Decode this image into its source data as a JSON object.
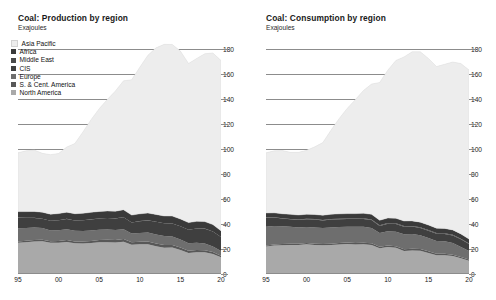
{
  "panels": [
    {
      "title": "Coal: Production by region",
      "subtitle": "Exajoules"
    },
    {
      "title": "Coal: Consumption by region",
      "subtitle": "Exajoules"
    }
  ],
  "legend": {
    "items": [
      {
        "label": "Asia Pacific",
        "color": "#ededed"
      },
      {
        "label": "Africa",
        "color": "#3a3a3a"
      },
      {
        "label": "Middle East",
        "color": "#4a4a4a"
      },
      {
        "label": "CIS",
        "color": "#3f3f3f"
      },
      {
        "label": "Europe",
        "color": "#6e6e6e"
      },
      {
        "label": "S. & Cent. America",
        "color": "#585858"
      },
      {
        "label": "North America",
        "color": "#a9a9a9"
      }
    ]
  },
  "axes": {
    "y_ticks": [
      0,
      20,
      40,
      60,
      80,
      100,
      120,
      140,
      160,
      180
    ],
    "y_min": 0,
    "y_max": 190,
    "x_ticks": [
      "95",
      "00",
      "05",
      "10",
      "15",
      "20"
    ],
    "x_tick_years": [
      1995,
      2000,
      2005,
      2010,
      2015,
      2020
    ],
    "x_min": 1995,
    "x_max": 2020,
    "ylabel": "Exajoules",
    "grid": true
  },
  "chart_data": {
    "type": "area",
    "stacked": true,
    "xlabel": "",
    "ylabel": "Exajoules",
    "ylim": [
      0,
      190
    ],
    "xlim": [
      1995,
      2020
    ],
    "legend_position": "top-left",
    "grid": true,
    "x": [
      1995,
      1996,
      1997,
      1998,
      1999,
      2000,
      2001,
      2002,
      2003,
      2004,
      2005,
      2006,
      2007,
      2008,
      2009,
      2010,
      2011,
      2012,
      2013,
      2014,
      2015,
      2016,
      2017,
      2018,
      2019,
      2020
    ],
    "charts": [
      {
        "name": "Coal: Production by region",
        "series": [
          {
            "name": "North America",
            "values": [
              25.0,
              25.4,
              26.0,
              26.2,
              24.9,
              25.0,
              25.6,
              24.5,
              24.3,
              24.7,
              25.4,
              25.4,
              25.1,
              25.8,
              23.4,
              23.7,
              23.8,
              22.1,
              21.0,
              21.1,
              19.1,
              16.7,
              17.3,
              17.3,
              15.9,
              13.3
            ]
          },
          {
            "name": "S. & Cent. America",
            "values": [
              1.0,
              1.1,
              1.2,
              1.2,
              1.3,
              1.4,
              1.5,
              1.5,
              1.6,
              1.7,
              1.8,
              1.9,
              2.0,
              2.1,
              2.0,
              2.1,
              2.2,
              2.2,
              2.2,
              2.1,
              2.0,
              1.9,
              1.8,
              1.7,
              1.6,
              1.2
            ]
          },
          {
            "name": "Europe",
            "values": [
              10.5,
              10.2,
              9.9,
              9.3,
              8.6,
              8.5,
              8.6,
              8.5,
              8.4,
              8.3,
              8.1,
              8.2,
              8.0,
              7.8,
              7.0,
              7.0,
              7.1,
              7.3,
              7.1,
              6.8,
              6.5,
              6.0,
              5.8,
              5.3,
              4.5,
              3.8
            ]
          },
          {
            "name": "CIS",
            "values": [
              8.5,
              8.2,
              7.7,
              7.4,
              7.7,
              8.0,
              8.3,
              8.2,
              8.6,
              8.9,
              9.0,
              9.2,
              9.3,
              9.6,
              8.7,
              9.4,
              9.7,
              10.1,
              10.2,
              10.3,
              10.5,
              10.7,
              11.4,
              11.9,
              11.9,
              11.2
            ]
          },
          {
            "name": "Middle East",
            "values": [
              0.03,
              0.03,
              0.03,
              0.03,
              0.03,
              0.03,
              0.03,
              0.03,
              0.03,
              0.03,
              0.03,
              0.03,
              0.03,
              0.03,
              0.03,
              0.03,
              0.03,
              0.03,
              0.03,
              0.03,
              0.03,
              0.03,
              0.03,
              0.03,
              0.03,
              0.03
            ]
          },
          {
            "name": "Africa",
            "values": [
              4.8,
              4.9,
              5.1,
              5.2,
              5.2,
              5.3,
              5.3,
              5.4,
              5.5,
              5.6,
              5.6,
              5.6,
              5.7,
              5.9,
              5.9,
              5.8,
              5.8,
              5.8,
              5.8,
              5.9,
              5.8,
              5.7,
              5.7,
              5.6,
              5.5,
              4.9
            ]
          },
          {
            "name": "Asia Pacific",
            "values": [
              47.0,
              48.5,
              49.0,
              47.0,
              47.5,
              48.0,
              52.0,
              56.0,
              65.0,
              74.0,
              82.0,
              89.0,
              96.0,
              103.0,
              108.0,
              117.0,
              126.0,
              133.0,
              137.0,
              137.0,
              134.0,
              127.0,
              130.0,
              134.0,
              137.0,
              136.0
            ]
          }
        ]
      },
      {
        "name": "Coal: Consumption by region",
        "series": [
          {
            "name": "North America",
            "values": [
              22.0,
              22.7,
              23.0,
              23.2,
              23.2,
              23.8,
              23.2,
              23.0,
              23.2,
              23.6,
              24.0,
              23.6,
              23.8,
              23.2,
              20.6,
              21.6,
              20.9,
              18.4,
              18.8,
              18.6,
              16.8,
              15.0,
              14.9,
              14.3,
              12.6,
              10.6
            ]
          },
          {
            "name": "S. & Cent. America",
            "values": [
              0.8,
              0.8,
              0.9,
              0.9,
              0.9,
              1.0,
              1.0,
              1.0,
              1.0,
              1.1,
              1.1,
              1.2,
              1.2,
              1.3,
              1.2,
              1.2,
              1.3,
              1.3,
              1.3,
              1.3,
              1.3,
              1.2,
              1.2,
              1.1,
              1.0,
              0.9
            ]
          },
          {
            "name": "Europe",
            "values": [
              15.0,
              14.8,
              14.3,
              13.7,
              13.0,
              12.8,
              13.0,
              12.7,
              13.0,
              12.9,
              12.7,
              12.9,
              12.8,
              12.3,
              11.0,
              11.3,
              11.6,
              12.0,
              11.8,
              11.0,
              10.7,
              10.2,
              10.0,
              9.3,
              8.0,
              6.8
            ]
          },
          {
            "name": "CIS",
            "values": [
              7.2,
              6.8,
              6.1,
              5.9,
              6.1,
              6.2,
              6.3,
              6.1,
              6.3,
              6.2,
              6.1,
              6.2,
              6.2,
              6.3,
              5.6,
              6.1,
              6.2,
              6.1,
              6.0,
              5.9,
              5.8,
              5.8,
              5.9,
              6.1,
              6.1,
              5.7
            ]
          },
          {
            "name": "Middle East",
            "values": [
              0.3,
              0.3,
              0.3,
              0.3,
              0.3,
              0.3,
              0.4,
              0.4,
              0.4,
              0.4,
              0.4,
              0.4,
              0.5,
              0.5,
              0.5,
              0.5,
              0.5,
              0.5,
              0.5,
              0.5,
              0.5,
              0.5,
              0.5,
              0.5,
              0.5,
              0.4
            ]
          },
          {
            "name": "Africa",
            "values": [
              3.4,
              3.4,
              3.5,
              3.6,
              3.6,
              3.6,
              3.6,
              3.7,
              3.8,
              3.8,
              3.9,
              3.9,
              4.0,
              4.0,
              4.0,
              4.0,
              4.0,
              4.0,
              4.0,
              4.1,
              4.0,
              3.9,
              3.9,
              3.9,
              3.8,
              3.5
            ]
          },
          {
            "name": "Asia Pacific",
            "values": [
              48.0,
              49.5,
              50.5,
              49.5,
              50.0,
              51.0,
              54.0,
              58.0,
              67.0,
              76.0,
              84.0,
              91.0,
              98.0,
              104.0,
              110.0,
              118.0,
              126.0,
              131.0,
              135.0,
              136.0,
              133.0,
              129.0,
              131.0,
              134.0,
              136.0,
              135.0
            ]
          }
        ]
      }
    ]
  }
}
